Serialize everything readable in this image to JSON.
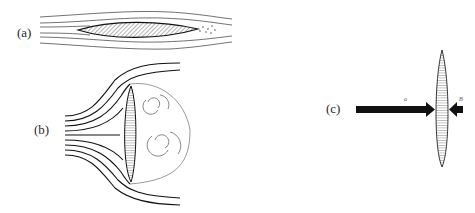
{
  "figure": {
    "panels": [
      {
        "id": "a",
        "label": "(a)",
        "description": "streamlined flow around lens-shaped body aligned with flow, small wake"
      },
      {
        "id": "b",
        "label": "(b)",
        "description": "flow around body perpendicular to stream with separated wake vortices"
      },
      {
        "id": "c",
        "label": "(c)",
        "description": "lens-shaped body with opposing force arrows"
      }
    ],
    "arrows": {
      "left_label": "a",
      "right_label": "B"
    },
    "colors": {
      "ink": "#1a1a1a",
      "hatch": "#444444",
      "background": "#ffffff"
    }
  }
}
